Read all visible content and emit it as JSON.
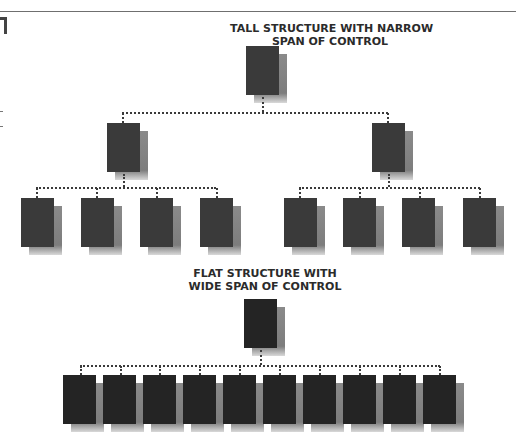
{
  "diagram": {
    "tall": {
      "title_line1": "TALL STRUCTURE WITH NARROW",
      "title_line2": "SPAN OF CONTROL",
      "levels": [
        {
          "level": 1,
          "count": 1
        },
        {
          "level": 2,
          "count": 2
        },
        {
          "level": 3,
          "count": 8
        }
      ]
    },
    "flat": {
      "title_line1": "FLAT STRUCTURE WITH",
      "title_line2": "WIDE SPAN OF CONTROL",
      "levels": [
        {
          "level": 1,
          "count": 1
        },
        {
          "level": 2,
          "count": 10
        }
      ]
    },
    "colors": {
      "box": "#3a3a3a",
      "box_flat": "#242424",
      "shadow": "#8a8a8a",
      "connector": "#3a3a3a"
    }
  }
}
